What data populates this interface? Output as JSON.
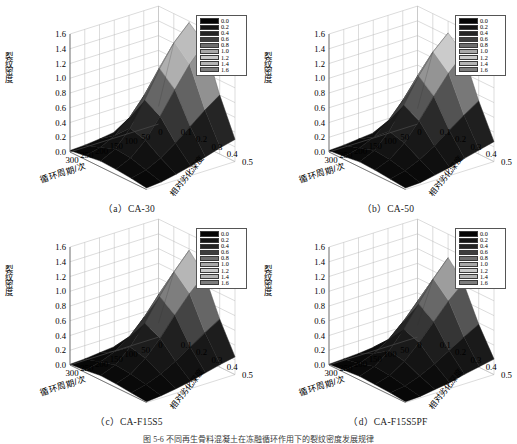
{
  "figure": {
    "caption": "图 5-6   不同再生骨料混凝土在冻融循环作用下的裂纹密度发展规律"
  },
  "axes_common": {
    "y_label": "裂纹密度",
    "x_label": "循环周期/次",
    "z_label": "相对劣化深度",
    "y_ticks": [
      "1.6",
      "1.4",
      "1.2",
      "1.0",
      "0.8",
      "0.6",
      "0.4",
      "0.2",
      "0.0"
    ],
    "x_ticks": [
      "300",
      "250",
      "200",
      "150",
      "100",
      "50",
      "0"
    ],
    "z_ticks": [
      "0.1",
      "0.2",
      "0.3",
      "0.4",
      "0.5"
    ]
  },
  "legend": {
    "labels": [
      "0.0",
      "0.2",
      "0.4",
      "0.6",
      "0.8",
      "1.0",
      "1.2",
      "1.4",
      "1.6"
    ],
    "colors": [
      "#050505",
      "#141414",
      "#242424",
      "#3d3d3d",
      "#6e6e6e",
      "#a8a8a8",
      "#c9c9c9",
      "#b4b4b4",
      "#7d7d7d"
    ]
  },
  "panels": [
    {
      "id": "a",
      "caption": "（a）CA-30",
      "peak": 1.6
    },
    {
      "id": "b",
      "caption": "（b）CA-50",
      "peak": 1.45
    },
    {
      "id": "c",
      "caption": "（c）CA-F15S5",
      "peak": 1.4
    },
    {
      "id": "d",
      "caption": "（d）CA-F15S5PF",
      "peak": 1.3
    }
  ],
  "chart_data": {
    "type": "surface",
    "title": "不同再生骨料混凝土在冻融循环作用下的裂纹密度发展规律",
    "xlabel": "循环周期/次",
    "ylabel": "相对劣化深度",
    "zlabel": "裂纹密度",
    "xlim": [
      0,
      300
    ],
    "ylim": [
      0,
      0.5
    ],
    "zlim": [
      0.0,
      1.6
    ],
    "colorbar": {
      "ticks": [
        0.0,
        0.2,
        0.4,
        0.6,
        0.8,
        1.0,
        1.2,
        1.4,
        1.6
      ],
      "colormap": "grayscale"
    },
    "grid": true,
    "legend_position": "top-right",
    "x": [
      0,
      50,
      100,
      150,
      200,
      250,
      300
    ],
    "y": [
      0.0,
      0.1,
      0.2,
      0.3,
      0.4,
      0.5
    ],
    "surfaces": [
      {
        "name": "CA-30",
        "panel": "a",
        "z": [
          [
            0.02,
            0.03,
            0.05,
            0.08,
            0.12,
            0.18,
            0.24
          ],
          [
            0.05,
            0.1,
            0.2,
            0.38,
            0.62,
            0.92,
            1.2
          ],
          [
            0.08,
            0.18,
            0.4,
            0.72,
            1.08,
            1.38,
            1.58
          ],
          [
            0.07,
            0.16,
            0.34,
            0.6,
            0.9,
            1.18,
            1.4
          ],
          [
            0.05,
            0.1,
            0.2,
            0.34,
            0.5,
            0.66,
            0.8
          ],
          [
            0.02,
            0.04,
            0.08,
            0.13,
            0.19,
            0.25,
            0.3
          ]
        ]
      },
      {
        "name": "CA-50",
        "panel": "b",
        "z": [
          [
            0.02,
            0.03,
            0.05,
            0.07,
            0.11,
            0.16,
            0.21
          ],
          [
            0.04,
            0.09,
            0.18,
            0.34,
            0.56,
            0.83,
            1.08
          ],
          [
            0.07,
            0.16,
            0.36,
            0.65,
            0.98,
            1.25,
            1.44
          ],
          [
            0.06,
            0.14,
            0.3,
            0.54,
            0.81,
            1.06,
            1.26
          ],
          [
            0.04,
            0.09,
            0.18,
            0.3,
            0.45,
            0.59,
            0.72
          ],
          [
            0.02,
            0.03,
            0.07,
            0.11,
            0.17,
            0.22,
            0.27
          ]
        ]
      },
      {
        "name": "CA-F15S5",
        "panel": "c",
        "z": [
          [
            0.01,
            0.02,
            0.04,
            0.06,
            0.1,
            0.14,
            0.19
          ],
          [
            0.03,
            0.08,
            0.16,
            0.3,
            0.5,
            0.75,
            0.98
          ],
          [
            0.06,
            0.14,
            0.32,
            0.58,
            0.88,
            1.16,
            1.38
          ],
          [
            0.05,
            0.12,
            0.27,
            0.48,
            0.73,
            0.96,
            1.15
          ],
          [
            0.03,
            0.08,
            0.16,
            0.27,
            0.4,
            0.53,
            0.65
          ],
          [
            0.01,
            0.03,
            0.06,
            0.1,
            0.15,
            0.2,
            0.24
          ]
        ]
      },
      {
        "name": "CA-F15S5PF",
        "panel": "d",
        "z": [
          [
            0.01,
            0.02,
            0.03,
            0.05,
            0.08,
            0.12,
            0.16
          ],
          [
            0.03,
            0.06,
            0.13,
            0.26,
            0.44,
            0.66,
            0.88
          ],
          [
            0.05,
            0.12,
            0.27,
            0.5,
            0.78,
            1.06,
            1.28
          ],
          [
            0.04,
            0.1,
            0.23,
            0.42,
            0.64,
            0.86,
            1.04
          ],
          [
            0.03,
            0.06,
            0.13,
            0.23,
            0.35,
            0.47,
            0.58
          ],
          [
            0.01,
            0.02,
            0.05,
            0.08,
            0.13,
            0.17,
            0.21
          ]
        ]
      }
    ]
  }
}
